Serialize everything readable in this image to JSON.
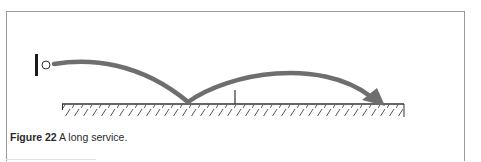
{
  "figure": {
    "label": "Figure 22",
    "caption": " A long service."
  },
  "diagram": {
    "elements": {
      "racket": "racket-icon",
      "ball": "shuttle-icon",
      "net": "net-post",
      "court": "court-floor-hatched",
      "trajectory": "service-flight-arrow"
    },
    "colors": {
      "trajectory": "#6e6e6e",
      "racket": "#1a1a1a",
      "ground": "#333333",
      "frame": "#9a9a9a"
    }
  }
}
